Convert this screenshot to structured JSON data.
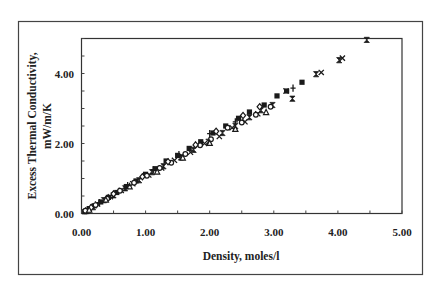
{
  "chart_data": {
    "type": "scatter",
    "title": "",
    "xlabel": "Density, moles/l",
    "ylabel": "Excess Thermal Conductivity, mW/m/K",
    "ylabel_lines": [
      "Excess Thermal Conductivity,",
      "mW/m/K"
    ],
    "xlim": [
      0,
      5
    ],
    "ylim": [
      0,
      5
    ],
    "x_ticks": [
      0,
      1,
      2,
      3,
      4,
      5
    ],
    "x_tick_labels": [
      "0.00",
      "1.00",
      "2.00",
      "3.00",
      "4.00",
      "5.00"
    ],
    "y_ticks": [
      0,
      2,
      4
    ],
    "y_tick_labels": [
      "0.00",
      "2.00",
      "4.00"
    ],
    "y_minor_step": 0.5,
    "x_minor_step": 0.5,
    "grid": false,
    "legend": null,
    "series": [
      {
        "name": "filled-square",
        "marker": "square-filled",
        "points": [
          [
            0.05,
            0.05
          ],
          [
            0.12,
            0.14
          ],
          [
            0.2,
            0.22
          ],
          [
            0.3,
            0.33
          ],
          [
            0.42,
            0.46
          ],
          [
            0.55,
            0.6
          ],
          [
            0.7,
            0.77
          ],
          [
            0.85,
            0.93
          ],
          [
            1.0,
            1.12
          ],
          [
            1.15,
            1.28
          ],
          [
            1.32,
            1.5
          ],
          [
            1.5,
            1.66
          ],
          [
            1.68,
            1.86
          ],
          [
            1.86,
            2.05
          ],
          [
            2.05,
            2.3
          ],
          [
            2.25,
            2.5
          ],
          [
            2.45,
            2.72
          ],
          [
            2.62,
            2.9
          ],
          [
            2.85,
            3.1
          ],
          [
            3.05,
            3.36
          ],
          [
            3.2,
            3.5
          ],
          [
            3.44,
            3.75
          ]
        ]
      },
      {
        "name": "bowtie",
        "marker": "bowtie",
        "points": [
          [
            0.08,
            0.07
          ],
          [
            0.18,
            0.18
          ],
          [
            0.35,
            0.38
          ],
          [
            0.5,
            0.52
          ],
          [
            0.68,
            0.72
          ],
          [
            0.9,
            0.95
          ],
          [
            1.1,
            1.18
          ],
          [
            1.28,
            1.35
          ],
          [
            1.55,
            1.6
          ],
          [
            1.75,
            1.82
          ],
          [
            1.98,
            2.05
          ],
          [
            2.2,
            2.3
          ],
          [
            2.4,
            2.5
          ],
          [
            2.62,
            2.75
          ],
          [
            2.8,
            2.95
          ],
          [
            2.98,
            3.1
          ],
          [
            3.29,
            3.28
          ],
          [
            3.66,
            3.98
          ],
          [
            4.02,
            4.38
          ],
          [
            4.45,
            4.96
          ]
        ]
      },
      {
        "name": "x-cross",
        "marker": "x",
        "points": [
          [
            0.1,
            0.1
          ],
          [
            0.25,
            0.27
          ],
          [
            0.45,
            0.48
          ],
          [
            0.62,
            0.66
          ],
          [
            0.8,
            0.85
          ],
          [
            1.05,
            1.1
          ],
          [
            1.25,
            1.3
          ],
          [
            1.45,
            1.52
          ],
          [
            1.7,
            1.75
          ],
          [
            1.92,
            2.0
          ],
          [
            2.15,
            2.2
          ],
          [
            2.35,
            2.45
          ],
          [
            2.55,
            2.62
          ],
          [
            2.75,
            2.85
          ],
          [
            3.19,
            3.5
          ],
          [
            3.74,
            4.03
          ],
          [
            4.07,
            4.44
          ]
        ]
      },
      {
        "name": "open-circle",
        "marker": "circle-open",
        "points": [
          [
            0.06,
            0.08
          ],
          [
            0.22,
            0.24
          ],
          [
            0.4,
            0.42
          ],
          [
            0.6,
            0.65
          ],
          [
            0.82,
            0.88
          ],
          [
            1.02,
            1.08
          ],
          [
            1.22,
            1.3
          ],
          [
            1.4,
            1.45
          ],
          [
            1.62,
            1.7
          ],
          [
            1.85,
            1.95
          ],
          [
            2.02,
            2.12
          ],
          [
            2.28,
            2.45
          ],
          [
            2.5,
            2.6
          ],
          [
            2.72,
            2.82
          ],
          [
            2.95,
            3.05
          ]
        ]
      },
      {
        "name": "open-diamond",
        "marker": "diamond-open",
        "points": [
          [
            0.15,
            0.17
          ],
          [
            0.5,
            0.56
          ],
          [
            0.95,
            1.05
          ],
          [
            1.35,
            1.48
          ],
          [
            1.78,
            1.96
          ],
          [
            2.1,
            2.35
          ],
          [
            2.52,
            2.8
          ],
          [
            2.78,
            3.05
          ]
        ]
      },
      {
        "name": "open-triangle",
        "marker": "triangle-open",
        "points": [
          [
            0.12,
            0.11
          ],
          [
            0.38,
            0.4
          ],
          [
            0.75,
            0.78
          ],
          [
            1.18,
            1.2
          ],
          [
            1.58,
            1.6
          ],
          [
            2.0,
            2.02
          ],
          [
            2.4,
            2.42
          ],
          [
            2.88,
            2.9
          ]
        ]
      },
      {
        "name": "plus",
        "marker": "plus",
        "points": [
          [
            0.28,
            0.31
          ],
          [
            0.72,
            0.8
          ],
          [
            1.12,
            1.25
          ],
          [
            1.52,
            1.68
          ],
          [
            2.0,
            2.28
          ],
          [
            2.4,
            2.62
          ],
          [
            3.3,
            3.58
          ]
        ]
      }
    ]
  },
  "figure": {
    "outer_frame": true
  }
}
